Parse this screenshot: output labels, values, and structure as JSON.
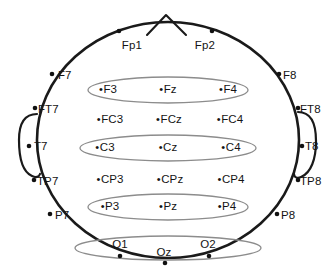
{
  "diagram": {
    "view": "top-down head schematic with nose at top and ears at sides",
    "colors": {
      "background": "#ffffff",
      "outline": "#1a1a1a",
      "ellipse": "#8c8c8c",
      "label": "#141414",
      "marker": "#111111"
    },
    "head": {
      "center_x": 168,
      "center_y": 140,
      "radius_x": 131,
      "radius_y": 118
    },
    "nose": {
      "name": "nose-marker",
      "apex_x": 166,
      "apex_y": 14
    },
    "ears": [
      {
        "name": "left-ear",
        "side": "left"
      },
      {
        "name": "right-ear",
        "side": "right"
      }
    ],
    "row_ellipses": [
      {
        "name": "frontal-row-ellipse",
        "cx": 168,
        "cy": 90,
        "rx": 80,
        "ry": 13
      },
      {
        "name": "central-row-ellipse",
        "cx": 168,
        "cy": 148,
        "rx": 88,
        "ry": 13
      },
      {
        "name": "parietal-row-ellipse",
        "cx": 168,
        "cy": 207,
        "rx": 80,
        "ry": 13
      },
      {
        "name": "occipital-row-ellipse",
        "cx": 168,
        "cy": 248,
        "rx": 93,
        "ry": 12
      }
    ],
    "electrodes": [
      {
        "id": "Fp1",
        "label": "Fp1",
        "x": 132,
        "y": 46,
        "dot_x": 119,
        "dot_y": 31,
        "style": "plain",
        "row": "prefrontal"
      },
      {
        "id": "Fp2",
        "label": "Fp2",
        "x": 205,
        "y": 46,
        "dot_x": 212,
        "dot_y": 31,
        "style": "plain",
        "row": "prefrontal"
      },
      {
        "id": "F7",
        "label": "F7",
        "x": 58,
        "y": 76,
        "dot_x": 52,
        "dot_y": 74,
        "style": "side-left",
        "row": "frontal"
      },
      {
        "id": "F3",
        "label": "F3",
        "x": 108,
        "y": 90,
        "style": "lead",
        "row": "frontal"
      },
      {
        "id": "Fz",
        "label": "Fz",
        "x": 168,
        "y": 90,
        "style": "lead",
        "row": "frontal"
      },
      {
        "id": "F4",
        "label": "F4",
        "x": 228,
        "y": 90,
        "style": "lead",
        "row": "frontal"
      },
      {
        "id": "F8",
        "label": "F8",
        "x": 283,
        "y": 76,
        "dot_x": 279,
        "dot_y": 74,
        "style": "side-right",
        "row": "frontal"
      },
      {
        "id": "FT7",
        "label": "FT7",
        "x": 38,
        "y": 110,
        "dot_x": 35,
        "dot_y": 108,
        "style": "side-left",
        "row": "fronto-central"
      },
      {
        "id": "FC3",
        "label": "FC3",
        "x": 110,
        "y": 120,
        "style": "lead",
        "row": "fronto-central"
      },
      {
        "id": "FCz",
        "label": "FCz",
        "x": 169,
        "y": 120,
        "style": "lead",
        "row": "fronto-central"
      },
      {
        "id": "FC4",
        "label": "FC4",
        "x": 230,
        "y": 120,
        "style": "lead",
        "row": "fronto-central"
      },
      {
        "id": "FT8",
        "label": "FT8",
        "x": 300,
        "y": 110,
        "dot_x": 298,
        "dot_y": 108,
        "style": "side-right",
        "row": "fronto-central"
      },
      {
        "id": "T7",
        "label": "T7",
        "x": 34,
        "y": 147,
        "dot_x": 29,
        "dot_y": 146,
        "style": "side-left",
        "row": "central"
      },
      {
        "id": "C3",
        "label": "C3",
        "x": 105,
        "y": 148,
        "style": "lead",
        "row": "central"
      },
      {
        "id": "Cz",
        "label": "Cz",
        "x": 168,
        "y": 148,
        "style": "lead",
        "row": "central"
      },
      {
        "id": "C4",
        "label": "C4",
        "x": 231,
        "y": 148,
        "style": "lead",
        "row": "central"
      },
      {
        "id": "T8",
        "label": "T8",
        "x": 305,
        "y": 147,
        "dot_x": 302,
        "dot_y": 146,
        "style": "side-right",
        "row": "central"
      },
      {
        "id": "TP7",
        "label": "TP7",
        "x": 37,
        "y": 182,
        "dot_x": 34,
        "dot_y": 180,
        "style": "side-left",
        "row": "centro-parietal"
      },
      {
        "id": "CP3",
        "label": "CP3",
        "x": 110,
        "y": 180,
        "style": "lead",
        "row": "centro-parietal"
      },
      {
        "id": "CPz",
        "label": "CPz",
        "x": 170,
        "y": 180,
        "style": "lead",
        "row": "centro-parietal"
      },
      {
        "id": "CP4",
        "label": "CP4",
        "x": 231,
        "y": 180,
        "style": "lead",
        "row": "centro-parietal"
      },
      {
        "id": "TP8",
        "label": "TP8",
        "x": 300,
        "y": 182,
        "dot_x": 298,
        "dot_y": 180,
        "style": "side-right",
        "row": "centro-parietal"
      },
      {
        "id": "P7",
        "label": "P7",
        "x": 55,
        "y": 216,
        "dot_x": 50,
        "dot_y": 214,
        "style": "side-left",
        "row": "parietal"
      },
      {
        "id": "P3",
        "label": "P3",
        "x": 110,
        "y": 207,
        "style": "lead",
        "row": "parietal"
      },
      {
        "id": "Pz",
        "label": "Pz",
        "x": 168,
        "y": 207,
        "style": "lead",
        "row": "parietal"
      },
      {
        "id": "P4",
        "label": "P4",
        "x": 227,
        "y": 207,
        "style": "lead",
        "row": "parietal"
      },
      {
        "id": "P8",
        "label": "P8",
        "x": 281,
        "y": 216,
        "dot_x": 277,
        "dot_y": 214,
        "style": "side-right",
        "row": "parietal"
      },
      {
        "id": "O1",
        "label": "O1",
        "x": 120,
        "y": 245,
        "dot_x": 120,
        "dot_y": 256,
        "style": "plain",
        "row": "occipital"
      },
      {
        "id": "Oz",
        "label": "Oz",
        "x": 164,
        "y": 253,
        "dot_x": 165,
        "dot_y": 263,
        "style": "plain",
        "row": "occipital"
      },
      {
        "id": "O2",
        "label": "O2",
        "x": 208,
        "y": 245,
        "dot_x": 209,
        "dot_y": 256,
        "style": "plain",
        "row": "occipital"
      }
    ]
  }
}
